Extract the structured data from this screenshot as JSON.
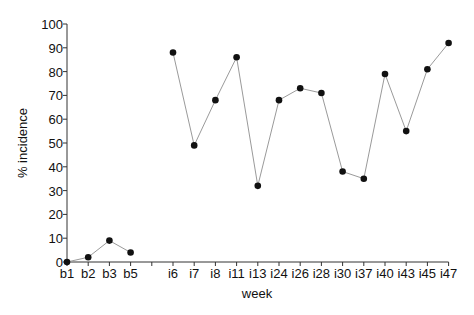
{
  "chart_data": {
    "type": "line",
    "title": "",
    "xlabel": "week",
    "ylabel": "% incidence",
    "ylim": [
      0,
      100
    ],
    "yticks": [
      0,
      10,
      20,
      30,
      40,
      50,
      60,
      70,
      80,
      90,
      100
    ],
    "grid": false,
    "legend": null,
    "categories": [
      "b1",
      "b2",
      "b3",
      "b5",
      "",
      "i6",
      "i7",
      "i8",
      "i11",
      "i13",
      "i24",
      "i26",
      "i28",
      "i30",
      "i37",
      "i40",
      "i43",
      "i45",
      "i47"
    ],
    "series": [
      {
        "name": "b",
        "x": [
          "b1",
          "b2",
          "b3",
          "b5"
        ],
        "values": [
          0,
          2,
          9,
          4
        ]
      },
      {
        "name": "i",
        "x": [
          "i6",
          "i7",
          "i8",
          "i11",
          "i13",
          "i24",
          "i26",
          "i28",
          "i30",
          "i37",
          "i40",
          "i43",
          "i45",
          "i47"
        ],
        "values": [
          88,
          49,
          68,
          86,
          32,
          68,
          73,
          71,
          38,
          35,
          79,
          55,
          81,
          92
        ]
      }
    ],
    "colors": {
      "line": "#9a9a9a",
      "marker": "#111111",
      "axis": "#333333"
    }
  }
}
